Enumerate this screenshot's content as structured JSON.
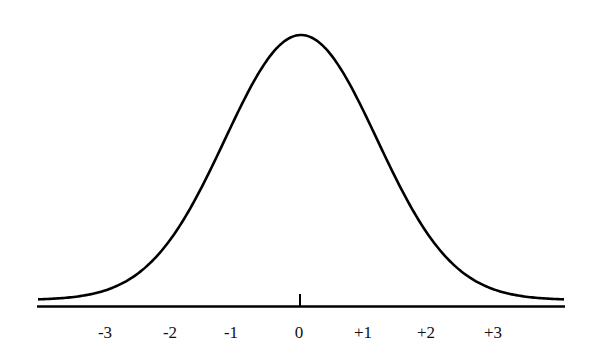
{
  "chart_data": {
    "type": "line",
    "title": "",
    "xlabel": "",
    "ylabel": "",
    "x_ticks": [
      "-3",
      "-2",
      "-1",
      "0",
      "+1",
      "+2",
      "+3"
    ],
    "x_tick_values": [
      -3,
      -2,
      -1,
      0,
      1,
      2,
      3
    ],
    "xlim": [
      -4,
      4
    ],
    "ylim": [
      0,
      0.4
    ],
    "grid": false,
    "legend": null,
    "series": [
      {
        "name": "normal density",
        "mean": 0,
        "sd": 1,
        "x": [
          -3.5,
          -3,
          -2.5,
          -2,
          -1.5,
          -1,
          -0.5,
          0,
          0.5,
          1,
          1.5,
          2,
          2.5,
          3,
          3.5
        ],
        "y": [
          0.0009,
          0.0044,
          0.0175,
          0.054,
          0.1295,
          0.242,
          0.3521,
          0.3989,
          0.3521,
          0.242,
          0.1295,
          0.054,
          0.0175,
          0.0044,
          0.0009
        ]
      }
    ],
    "colors": {
      "line": "#000000",
      "axis": "#000000",
      "background": "#ffffff"
    }
  },
  "axis": {
    "labels": [
      {
        "text": "-3",
        "x": 105
      },
      {
        "text": "-2",
        "x": 170
      },
      {
        "text": "-1",
        "x": 231
      },
      {
        "text": "0",
        "x": 299
      },
      {
        "text": "+1",
        "x": 363
      },
      {
        "text": "+2",
        "x": 426
      },
      {
        "text": "+3",
        "x": 493
      }
    ]
  }
}
